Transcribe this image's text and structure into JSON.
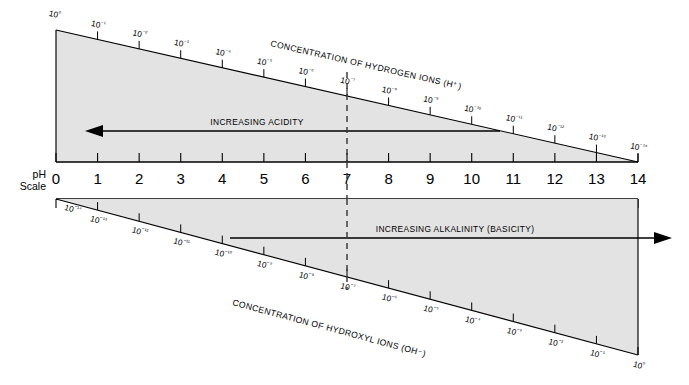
{
  "diagram": {
    "title": "pH Scale",
    "scale_label_line1": "pH",
    "scale_label_line2": "Scale",
    "top_caption": "CONCENTRATION OF HYDROGEN IONS (H⁺)",
    "bottom_caption": "CONCENTRATION OF HYDROXYL IONS (OH⁻)",
    "acidity_arrow_label": "INCREASING ACIDITY",
    "alkalinity_arrow_label": "INCREASING ALKALINITY (BASICITY)",
    "neutral_ph": 7,
    "colors": {
      "fill": "#e3e3e3",
      "line": "#000000",
      "background": "#ffffff",
      "dashed": "#333333"
    }
  },
  "chart_data": {
    "type": "line",
    "title": "pH Scale",
    "xlabel": "pH Scale",
    "ylabel": "",
    "xlim": [
      0,
      14
    ],
    "grid": false,
    "legend": "none",
    "categories": [
      "0",
      "1",
      "2",
      "3",
      "4",
      "5",
      "6",
      "7",
      "8",
      "9",
      "10",
      "11",
      "12",
      "13",
      "14"
    ],
    "series": [
      {
        "name": "CONCENTRATION OF HYDROGEN IONS (H+)",
        "position": "top",
        "exponents": [
          0,
          -1,
          -2,
          -3,
          -4,
          -5,
          -6,
          -7,
          -8,
          -9,
          -10,
          -11,
          -12,
          -13,
          -14
        ],
        "labels": [
          "10⁰",
          "10⁻¹",
          "10⁻²",
          "10⁻³",
          "10⁻⁴",
          "10⁻⁵",
          "10⁻⁶",
          "10⁻⁷",
          "10⁻⁸",
          "10⁻⁹",
          "10⁻¹⁰",
          "10⁻¹¹",
          "10⁻¹²",
          "10⁻¹³",
          "10⁻¹⁴"
        ]
      },
      {
        "name": "CONCENTRATION OF HYDROXYL IONS (OH-)",
        "position": "bottom",
        "exponents": [
          -14,
          -13,
          -12,
          -11,
          -10,
          -9,
          -8,
          -7,
          -6,
          -5,
          -4,
          -3,
          -2,
          -1,
          0
        ],
        "labels": [
          "10⁻¹⁴",
          "10⁻¹³",
          "10⁻¹²",
          "10⁻¹¹",
          "10⁻¹⁰",
          "10⁻⁹",
          "10⁻⁸",
          "10⁻⁷",
          "10⁻⁶",
          "10⁻⁵",
          "10⁻⁴",
          "10⁻³",
          "10⁻²",
          "10⁻¹",
          "10⁰"
        ]
      }
    ],
    "annotations": [
      {
        "text": "INCREASING ACIDITY",
        "direction": "left",
        "region": "top"
      },
      {
        "text": "INCREASING ALKALINITY (BASICITY)",
        "direction": "right",
        "region": "bottom"
      },
      {
        "text": "neutral",
        "ph": 7,
        "style": "dashed-vertical"
      }
    ]
  },
  "ph_ticks": [
    {
      "value": "0"
    },
    {
      "value": "1"
    },
    {
      "value": "2"
    },
    {
      "value": "3"
    },
    {
      "value": "4"
    },
    {
      "value": "5"
    },
    {
      "value": "6"
    },
    {
      "value": "7"
    },
    {
      "value": "8"
    },
    {
      "value": "9"
    },
    {
      "value": "10"
    },
    {
      "value": "11"
    },
    {
      "value": "12"
    },
    {
      "value": "13"
    },
    {
      "value": "14"
    }
  ]
}
